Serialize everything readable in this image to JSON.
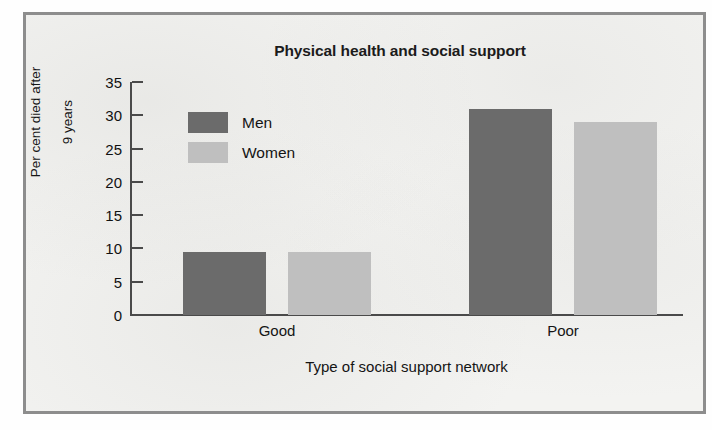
{
  "chart_data": {
    "type": "bar",
    "title": "Physical health and social support",
    "xlabel": "Type of social support network",
    "ylabel": "Per cent died after\n9 years",
    "categories": [
      "Good",
      "Poor"
    ],
    "series": [
      {
        "name": "Men",
        "color": "#6b6b6b",
        "values": [
          9.5,
          31
        ]
      },
      {
        "name": "Women",
        "color": "#bfbfbf",
        "values": [
          9.5,
          29
        ]
      }
    ],
    "ylim": [
      0,
      35
    ],
    "yticks": [
      0,
      5,
      10,
      15,
      20,
      25,
      30,
      35
    ],
    "ytick_labels": [
      "0",
      "5",
      "10",
      "15",
      "20",
      "25",
      "30",
      "35"
    ],
    "grid": false,
    "legend_position": "upper-left-inside",
    "frame_color": "#8d8d8d",
    "axis_color": "#4a4a4a",
    "background_color": "#f3f3f1"
  },
  "figure": {
    "title": "Physical health and social support",
    "ylabel_line1": "Per cent died after",
    "ylabel_line2": "9 years",
    "xlabel": "Type of social support network"
  },
  "legend": {
    "items": [
      {
        "label": "Men",
        "swatch": "men"
      },
      {
        "label": "Women",
        "swatch": "women"
      }
    ]
  },
  "ticks": {
    "labels": [
      "35",
      "30",
      "25",
      "20",
      "15",
      "10",
      "5",
      "0"
    ]
  },
  "categories": [
    {
      "label": "Good"
    },
    {
      "label": "Poor"
    }
  ]
}
